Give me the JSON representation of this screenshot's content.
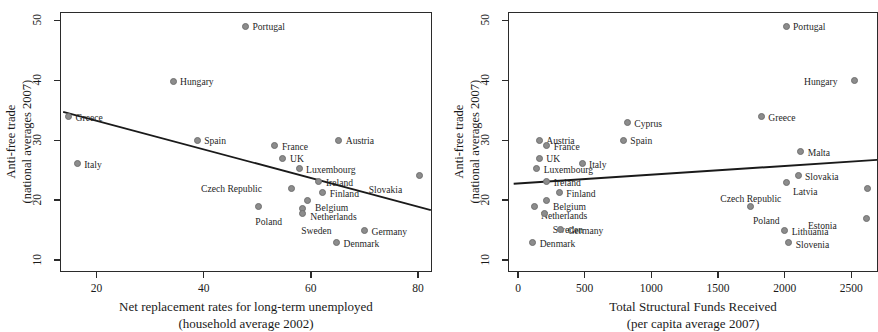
{
  "figure": {
    "background": "#ffffff",
    "dot_color": "#8c8c8c",
    "axis_color": "#2b2b2b",
    "line_color": "#1a1a1a"
  },
  "chart_data": [
    {
      "type": "scatter",
      "panel": "left",
      "title": "",
      "xlabel": "Net replacement rates for long-term unemployed",
      "xlabel_line2": "(household average 2002)",
      "ylabel": "Anti-free trade",
      "ylabel_line2": "(national averages 2007)",
      "xlim": [
        13.2,
        82.6
      ],
      "ylim": [
        8.0,
        51.4
      ],
      "xticks": [
        20,
        40,
        60,
        80
      ],
      "yticks": [
        10,
        20,
        30,
        40,
        50
      ],
      "xticklabels": [
        "20",
        "40",
        "60",
        "80"
      ],
      "yticklabels": [
        "10",
        "20",
        "30",
        "40",
        "50"
      ],
      "grid": false,
      "legend": "none",
      "fit_line": {
        "x0": 13.6,
        "y0": 34.9,
        "x1": 82.2,
        "y1": 18.5
      },
      "points": [
        {
          "label": "Portugal",
          "x": 47.8,
          "y": 49.0,
          "lx": 7,
          "ly": -4
        },
        {
          "label": "Hungary",
          "x": 34.3,
          "y": 39.8,
          "lx": 7,
          "ly": -4
        },
        {
          "label": "Greece",
          "x": 14.8,
          "y": 33.9,
          "lx": 7,
          "ly": -4
        },
        {
          "label": "Italy",
          "x": 16.4,
          "y": 26.1,
          "lx": 7,
          "ly": -4
        },
        {
          "label": "Spain",
          "x": 38.8,
          "y": 30.0,
          "lx": 7,
          "ly": -4
        },
        {
          "label": "Austria",
          "x": 65.2,
          "y": 30.0,
          "lx": 7,
          "ly": -4
        },
        {
          "label": "France",
          "x": 53.3,
          "y": 29.1,
          "lx": 7,
          "ly": -4
        },
        {
          "label": "UK",
          "x": 54.8,
          "y": 27.0,
          "lx": 7,
          "ly": -4
        },
        {
          "label": "Luxembourg",
          "x": 57.8,
          "y": 25.2,
          "lx": 7,
          "ly": -4
        },
        {
          "label": "Ireland",
          "x": 61.5,
          "y": 23.1,
          "lx": 7,
          "ly": -4
        },
        {
          "label": "Slovakia",
          "x": 80.3,
          "y": 24.1,
          "lx": -51,
          "ly": 9
        },
        {
          "label": "Czech Republic",
          "x": 56.3,
          "y": 22.0,
          "lx": -90,
          "ly": -4
        },
        {
          "label": "Finland",
          "x": 62.2,
          "y": 21.3,
          "lx": 7,
          "ly": -3
        },
        {
          "label": "Belgium",
          "x": 59.3,
          "y": 20.0,
          "lx": 8,
          "ly": 3
        },
        {
          "label": "Netherlands",
          "x": 58.4,
          "y": 18.6,
          "lx": 8,
          "ly": 4
        },
        {
          "label": "Poland",
          "x": 50.2,
          "y": 18.9,
          "lx": -3,
          "ly": 10
        },
        {
          "label": "Sweden",
          "x": 58.4,
          "y": 17.7,
          "lx": -1,
          "ly": 12
        },
        {
          "label": "Germany",
          "x": 70.0,
          "y": 15.0,
          "lx": 7,
          "ly": -3
        },
        {
          "label": "Denmark",
          "x": 64.8,
          "y": 13.0,
          "lx": 7,
          "ly": -3
        }
      ]
    },
    {
      "type": "scatter",
      "panel": "right",
      "title": "",
      "xlabel": "Total Structural Funds Received",
      "xlabel_line2": "(per capita average 2007)",
      "ylabel": "Anti-free trade",
      "ylabel_line2": "(national averages 2007)",
      "xlim": [
        -75,
        2700
      ],
      "ylim": [
        8.0,
        51.4
      ],
      "xticks": [
        0,
        500,
        1000,
        1500,
        2000,
        2500
      ],
      "yticks": [
        10,
        20,
        30,
        40,
        50
      ],
      "xticklabels": [
        "0",
        "500",
        "1000",
        "1500",
        "2000",
        "2500"
      ],
      "yticklabels": [
        "10",
        "20",
        "30",
        "40",
        "50"
      ],
      "grid": false,
      "legend": "none",
      "fit_line": {
        "x0": -40,
        "y0": 22.9,
        "x1": 2700,
        "y1": 26.9
      },
      "points": [
        {
          "label": "Portugal",
          "x": 2010,
          "y": 49.0,
          "lx": 7,
          "ly": -4
        },
        {
          "label": "Hungary",
          "x": 2520,
          "y": 39.9,
          "lx": -50,
          "ly": -4
        },
        {
          "label": "Greece",
          "x": 1825,
          "y": 33.9,
          "lx": 7,
          "ly": -4
        },
        {
          "label": "Cyprus",
          "x": 820,
          "y": 32.9,
          "lx": 7,
          "ly": -4
        },
        {
          "label": "Spain",
          "x": 790,
          "y": 30.0,
          "lx": 7,
          "ly": -4
        },
        {
          "label": "Austria",
          "x": 160,
          "y": 30.0,
          "lx": 7,
          "ly": -4
        },
        {
          "label": "France",
          "x": 215,
          "y": 29.1,
          "lx": 7,
          "ly": -4
        },
        {
          "label": "Malta",
          "x": 2120,
          "y": 28.1,
          "lx": 7,
          "ly": -4
        },
        {
          "label": "UK",
          "x": 160,
          "y": 27.0,
          "lx": 7,
          "ly": -4
        },
        {
          "label": "Italy",
          "x": 480,
          "y": 26.1,
          "lx": 7,
          "ly": -4
        },
        {
          "label": "Luxembourg",
          "x": 140,
          "y": 25.2,
          "lx": 7,
          "ly": -4
        },
        {
          "label": "Slovakia",
          "x": 2100,
          "y": 24.1,
          "lx": 7,
          "ly": -4
        },
        {
          "label": "Ireland",
          "x": 215,
          "y": 23.1,
          "lx": 7,
          "ly": -4
        },
        {
          "label": "Latvia",
          "x": 2010,
          "y": 23.0,
          "lx": 7,
          "ly": 5
        },
        {
          "label": "Czech Republic",
          "x": 2620,
          "y": 22.0,
          "lx": -147,
          "ly": 6
        },
        {
          "label": "Finland",
          "x": 310,
          "y": 21.3,
          "lx": 7,
          "ly": -3
        },
        {
          "label": "Belgium",
          "x": 210,
          "y": 20.0,
          "lx": 7,
          "ly": 2
        },
        {
          "label": "Netherlands",
          "x": 120,
          "y": 18.9,
          "lx": 7,
          "ly": 4
        },
        {
          "label": "Poland",
          "x": 1740,
          "y": 19.0,
          "lx": 3,
          "ly": 10
        },
        {
          "label": "Sweden",
          "x": 200,
          "y": 17.7,
          "lx": 8,
          "ly": 11
        },
        {
          "label": "Estonia",
          "x": 2610,
          "y": 17.0,
          "lx": -58,
          "ly": 3
        },
        {
          "label": "Germany",
          "x": 320,
          "y": 15.1,
          "lx": 7,
          "ly": -3
        },
        {
          "label": "Lithuania",
          "x": 2000,
          "y": 15.0,
          "lx": 7,
          "ly": -3
        },
        {
          "label": "Denmark",
          "x": 110,
          "y": 13.0,
          "lx": 7,
          "ly": -3
        },
        {
          "label": "Slovenia",
          "x": 2030,
          "y": 12.9,
          "lx": 7,
          "ly": -3
        }
      ]
    }
  ]
}
